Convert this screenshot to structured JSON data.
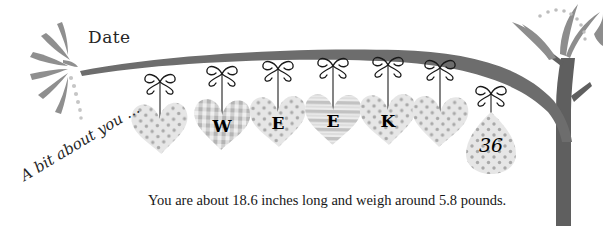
{
  "page": {
    "background_color": "#ffffff",
    "ink_color": "#1d1d1d"
  },
  "labels": {
    "date": "Date",
    "about_you": "A bit about you …",
    "body_text": "You are about 18.6 inches long and weigh around 5.8 pounds."
  },
  "palette": {
    "branch_dark": "#6b6b6b",
    "trunk_dark": "#5e5e5e",
    "leaf_gray": "#8c8c8c",
    "heart_light": "#e4e4e4",
    "heart_mid": "#d2d2d2",
    "pattern_dot": "#a9a9a9",
    "bow_black": "#1a1a1a",
    "egg_fill": "#cfcfcf",
    "dot_gray": "#bfbfbf"
  },
  "garland": {
    "hanging_items": [
      {
        "name": "heart-1",
        "shape": "heart",
        "pattern": "dots",
        "letter": "",
        "cx": 160,
        "cy": 128,
        "w": 56,
        "h": 58,
        "string_top": 80,
        "bow_y": 82,
        "tilt": -3
      },
      {
        "name": "heart-2",
        "shape": "heart",
        "pattern": "gingham",
        "letter": "W",
        "cx": 222,
        "cy": 124,
        "w": 56,
        "h": 58,
        "string_top": 72,
        "bow_y": 74,
        "tilt": 2
      },
      {
        "name": "heart-3",
        "shape": "heart",
        "pattern": "dots",
        "letter": "E",
        "cx": 278,
        "cy": 121,
        "w": 56,
        "h": 58,
        "string_top": 67,
        "bow_y": 69,
        "tilt": -2
      },
      {
        "name": "heart-4",
        "shape": "heart",
        "pattern": "stripes",
        "letter": "E",
        "cx": 333,
        "cy": 119,
        "w": 56,
        "h": 58,
        "string_top": 64,
        "bow_y": 66,
        "tilt": 1
      },
      {
        "name": "heart-5",
        "shape": "heart",
        "pattern": "dots",
        "letter": "K",
        "cx": 388,
        "cy": 119,
        "w": 56,
        "h": 58,
        "string_top": 63,
        "bow_y": 65,
        "tilt": -2
      },
      {
        "name": "heart-6",
        "shape": "heart",
        "pattern": "dots",
        "letter": "",
        "cx": 440,
        "cy": 121,
        "w": 56,
        "h": 58,
        "string_top": 66,
        "bow_y": 68,
        "tilt": 2
      },
      {
        "name": "egg-tag",
        "shape": "egg",
        "pattern": "dots",
        "letter": "36",
        "cx": 491,
        "cy": 143,
        "w": 50,
        "h": 62,
        "string_top": 92,
        "bow_y": 94,
        "tilt": 0
      }
    ],
    "week_word": "WEEK",
    "week_number": "36"
  },
  "decor": {
    "left_fan_leaves": 6,
    "right_tree_leaves": 4,
    "dotted_arc_dots": 9,
    "branch_label": "tree-branch",
    "trunk_label": "tree-trunk"
  }
}
